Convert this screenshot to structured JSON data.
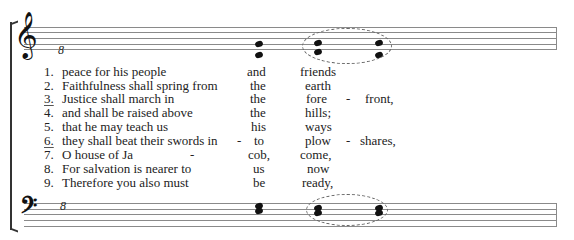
{
  "score": {
    "treble_clef_symbol": "𝄞",
    "bass_clef_symbol": "𝄢",
    "octave_mark_treble": "8",
    "octave_mark_bass": "8",
    "accent_color": "#111111",
    "staff_line_color": "#8a8a8a"
  },
  "verses": [
    {
      "num": "1.",
      "underlined": false,
      "text": "peace for his people",
      "hyph1": "",
      "col2": "and",
      "col3": "friends",
      "hyph2": "",
      "col4": ""
    },
    {
      "num": "2.",
      "underlined": false,
      "text": "Faithfulness shall spring from",
      "hyph1": "",
      "col2": "the",
      "col3": "earth",
      "hyph2": "",
      "col4": ""
    },
    {
      "num": "3.",
      "underlined": true,
      "text": "Justice shall march in",
      "hyph1": "",
      "col2": "the",
      "col3": "fore",
      "hyph2": "-",
      "col4": "front,"
    },
    {
      "num": "4.",
      "underlined": false,
      "text": "and shall be raised above",
      "hyph1": "",
      "col2": "the",
      "col3": "hills;",
      "hyph2": "",
      "col4": ""
    },
    {
      "num": "5.",
      "underlined": false,
      "text": "that he may teach us",
      "hyph1": "",
      "col2": "his",
      "col3": "ways",
      "hyph2": "",
      "col4": ""
    },
    {
      "num": "6.",
      "underlined": true,
      "text": "they shall beat their swords in",
      "hyph1": "-",
      "col2": "to",
      "col3": "plow",
      "hyph2": "-",
      "col4": "shares,"
    },
    {
      "num": "7.",
      "underlined": false,
      "text": "O house of Ja",
      "hyph1": "-",
      "col2": "cob,",
      "col3": "come,",
      "hyph2": "",
      "col4": ""
    },
    {
      "num": "8.",
      "underlined": false,
      "text": "For salvation is nearer to",
      "hyph1": "",
      "col2": "us",
      "col3": "now",
      "hyph2": "",
      "col4": ""
    },
    {
      "num": "9.",
      "underlined": false,
      "text": "Therefore you also must",
      "hyph1": "",
      "col2": "be",
      "col3": "ready,",
      "hyph2": "",
      "col4": ""
    }
  ]
}
